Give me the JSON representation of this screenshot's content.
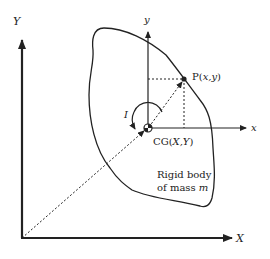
{
  "diagram": {
    "global_axes": {
      "x_label": "X",
      "y_label": "Y"
    },
    "body_axes": {
      "x_label": "x",
      "y_label": "y"
    },
    "point": {
      "label_prefix": "P(",
      "label_vars": "x,y",
      "label_suffix": ")"
    },
    "center_of_gravity": {
      "label_prefix": "CG(",
      "label_vars": "X,Y",
      "label_suffix": ")"
    },
    "moment_of_inertia_label": "I",
    "body_caption": {
      "line1": "Rigid body",
      "line2_prefix": "of mass ",
      "line2_var": "m"
    },
    "colors": {
      "stroke": "#222222",
      "background": "#ffffff"
    }
  }
}
